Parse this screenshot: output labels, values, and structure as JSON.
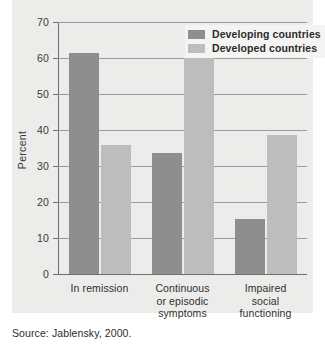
{
  "chart_data": {
    "type": "bar",
    "title": "",
    "xlabel": "",
    "ylabel": "Percent",
    "ylim": [
      0,
      70
    ],
    "yticks": [
      0,
      10,
      20,
      30,
      40,
      50,
      60,
      70
    ],
    "grid": true,
    "legend_position": "top-right",
    "categories": [
      "In remission",
      "Continuous\nor episodic\nsymptoms",
      "Impaired\nsocial\nfunctioning"
    ],
    "series": [
      {
        "name": "Developing countries",
        "color": "#8e8e8e",
        "values": [
          61.3,
          33.5,
          15.2
        ]
      },
      {
        "name": "Developed countries",
        "color": "#bdbdbd",
        "values": [
          35.8,
          60.0,
          38.7
        ]
      }
    ]
  },
  "legend": {
    "items": [
      {
        "label": "Developing countries",
        "swatch": "dark"
      },
      {
        "label": "Developed countries",
        "swatch": "light"
      }
    ]
  },
  "yticks": {
    "t0": "0",
    "t1": "10",
    "t2": "20",
    "t3": "30",
    "t4": "40",
    "t5": "50",
    "t6": "60",
    "t7": "70"
  },
  "axis": {
    "ylabel": "Percent"
  },
  "categories": {
    "c0": "In remission",
    "c1": "Continuous\nor episodic\nsymptoms",
    "c2": "Impaired\nsocial\nfunctioning"
  },
  "source": {
    "text": "Source: Jablensky, 2000."
  }
}
